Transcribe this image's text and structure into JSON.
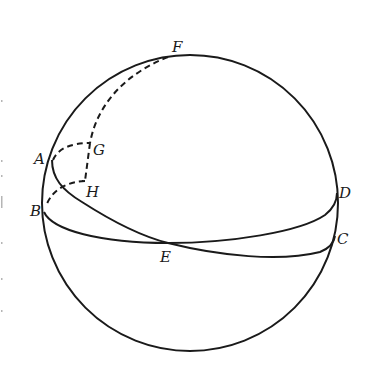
{
  "figure": {
    "type": "spherical-geometry-diagram",
    "sphere": {
      "cx": 190,
      "cy": 203,
      "r": 148
    },
    "labels": {
      "A": "A",
      "B": "B",
      "C": "C",
      "D": "D",
      "E": "E",
      "F": "F",
      "G": "G",
      "H": "H"
    },
    "points": {
      "A": [
        52,
        160
      ],
      "B": [
        44,
        212
      ],
      "C": [
        334,
        237
      ],
      "D": [
        337,
        193
      ],
      "E": [
        168,
        243
      ],
      "F": [
        168,
        56
      ],
      "G": [
        90,
        143
      ],
      "H": [
        82,
        180
      ]
    },
    "colors": {
      "ink": "#1a1a1a",
      "background": "#ffffff"
    }
  }
}
